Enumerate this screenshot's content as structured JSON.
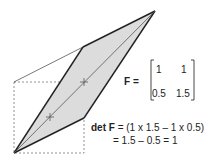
{
  "diagram": {
    "matrix_label": "F =",
    "matrix": {
      "r1c1": "1",
      "r1c2": "1",
      "r2c1": "0.5",
      "r2c2": "1.5"
    },
    "det_label": "det F",
    "det_line1": " = (1 x 1.5 – 1 x 0.5)",
    "det_line2": "= 1.5 – 0.5 = 1",
    "colors": {
      "fill": "#dcdcdc",
      "stroke": "#222222",
      "dashed": "#777777"
    }
  }
}
